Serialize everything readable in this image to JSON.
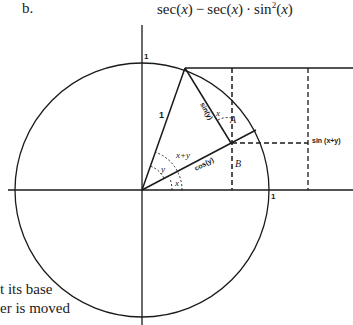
{
  "header": {
    "problem_label": "b.",
    "expression_parts": {
      "sec1": "sec(",
      "x1": "x",
      "mid": ") − sec(",
      "x2": "x",
      "dot": ") · sin",
      "exp": "2",
      "open": "(",
      "x3": "x",
      "close": ")"
    }
  },
  "diagram": {
    "axis_label_top": "1",
    "axis_label_right": "1",
    "hypotenuse_label": "1",
    "sin_y_label": "sin(y)",
    "cos_y_label": "cos(y)",
    "sin_x_plus_y_label": "sin (x+y)",
    "angle_x_label": "x",
    "angle_y_label": "y",
    "angle_x_plus_y_label": "x+y",
    "angle_x_at_top_label": "x",
    "point_a_label": "A",
    "point_b_label": "B"
  },
  "side_text": {
    "line1": "t its base",
    "line2": "er is moved"
  },
  "colors": {
    "line": "#1a1a1a",
    "background": "#ffffff"
  }
}
